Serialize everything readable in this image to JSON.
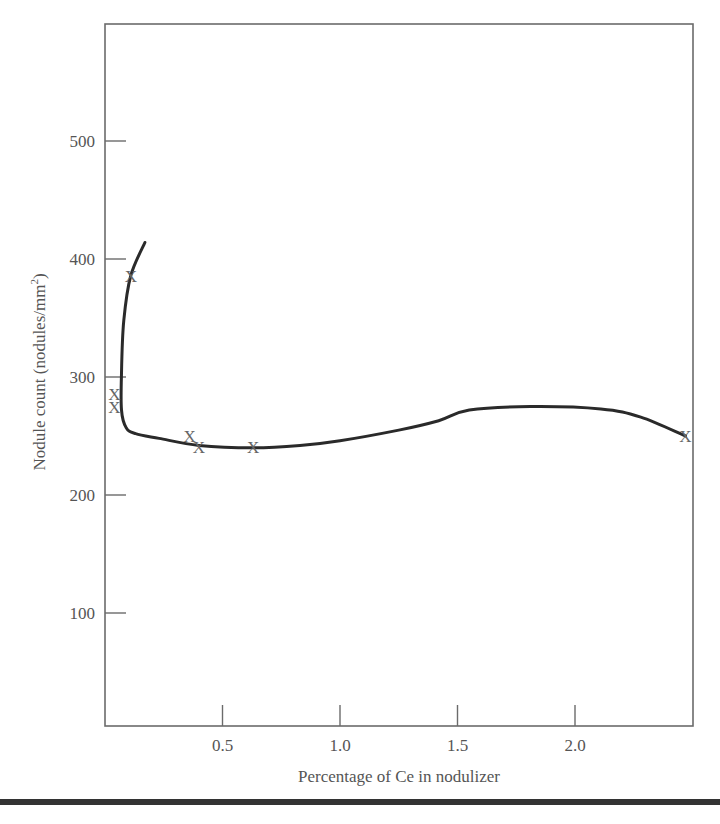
{
  "chart_data": {
    "type": "scatter",
    "title": "",
    "xlabel": "Percentage of Ce in nodulizer",
    "ylabel": "Nodule count (nodules/mm",
    "ylabel_superscript": "2",
    "ylabel_close": ")",
    "xlim": [
      0,
      2.5
    ],
    "ylim": [
      4,
      600
    ],
    "grid": false,
    "legend": null,
    "x_ticks": [
      {
        "value": 0.5,
        "label": "0.5"
      },
      {
        "value": 1.0,
        "label": "1.0"
      },
      {
        "value": 1.5,
        "label": "1.5"
      },
      {
        "value": 2.0,
        "label": "2.0"
      }
    ],
    "y_ticks": [
      {
        "value": 100,
        "label": "100"
      },
      {
        "value": 200,
        "label": "200"
      },
      {
        "value": 300,
        "label": "300"
      },
      {
        "value": 400,
        "label": "400"
      },
      {
        "value": 500,
        "label": "500"
      }
    ],
    "marker_symbol": "X",
    "series": [
      {
        "name": "measured",
        "kind": "markers",
        "points": [
          {
            "x": 0.04,
            "y": 286
          },
          {
            "x": 0.04,
            "y": 275
          },
          {
            "x": 0.11,
            "y": 386
          },
          {
            "x": 0.36,
            "y": 250
          },
          {
            "x": 0.4,
            "y": 241
          },
          {
            "x": 0.63,
            "y": 241
          },
          {
            "x": 2.47,
            "y": 250
          }
        ]
      },
      {
        "name": "fitted trend",
        "kind": "line",
        "points": [
          {
            "x": 0.17,
            "y": 414
          },
          {
            "x": 0.11,
            "y": 386
          },
          {
            "x": 0.08,
            "y": 348
          },
          {
            "x": 0.07,
            "y": 303
          },
          {
            "x": 0.07,
            "y": 272
          },
          {
            "x": 0.09,
            "y": 257
          },
          {
            "x": 0.13,
            "y": 252
          },
          {
            "x": 0.23,
            "y": 248
          },
          {
            "x": 0.4,
            "y": 242
          },
          {
            "x": 0.63,
            "y": 240
          },
          {
            "x": 0.83,
            "y": 242
          },
          {
            "x": 1.0,
            "y": 246
          },
          {
            "x": 1.25,
            "y": 255
          },
          {
            "x": 1.42,
            "y": 263
          },
          {
            "x": 1.55,
            "y": 272
          },
          {
            "x": 1.81,
            "y": 275
          },
          {
            "x": 2.11,
            "y": 273
          },
          {
            "x": 2.28,
            "y": 266
          },
          {
            "x": 2.47,
            "y": 250
          }
        ]
      }
    ]
  },
  "layout_px": {
    "plot_left": 105,
    "plot_right": 693,
    "plot_top": 24,
    "plot_bottom": 726,
    "x0_px": 105,
    "px_per_x": 235,
    "y0_px": 731,
    "px_per_y": 1.18
  }
}
